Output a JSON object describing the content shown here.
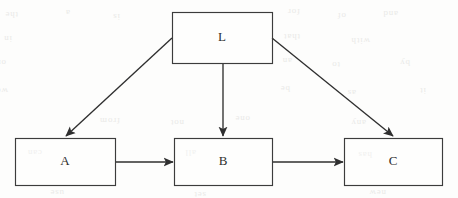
{
  "figure": {
    "kind": "directed-acyclic-graph",
    "title": "",
    "width": 458,
    "height": 198,
    "background_color": "#fdfdfc",
    "stroke_color": "#2f2f2f",
    "box_stroke_color": "#3c3c3c",
    "label_color": "#2e2e2e"
  },
  "nodes": [
    {
      "id": "L",
      "label": "L",
      "x": 172,
      "y": 12,
      "w": 100,
      "h": 51
    },
    {
      "id": "A",
      "label": "A",
      "x": 15,
      "y": 138,
      "w": 100,
      "h": 47
    },
    {
      "id": "B",
      "label": "B",
      "x": 174,
      "y": 138,
      "w": 98,
      "h": 47
    },
    {
      "id": "C",
      "label": "C",
      "x": 344,
      "y": 138,
      "w": 98,
      "h": 47
    }
  ],
  "edges": [
    {
      "id": "L-A",
      "from": "L",
      "to": "A",
      "shape": "diagonal",
      "x1": 172,
      "y1": 38,
      "x2": 66,
      "y2": 136
    },
    {
      "id": "L-B",
      "from": "L",
      "to": "B",
      "shape": "vertical",
      "x1": 223,
      "y1": 63,
      "x2": 223,
      "y2": 136
    },
    {
      "id": "L-C",
      "from": "L",
      "to": "C",
      "shape": "diagonal",
      "x1": 272,
      "y1": 38,
      "x2": 393,
      "y2": 136
    },
    {
      "id": "A-B",
      "from": "A",
      "to": "B",
      "shape": "horizontal",
      "x1": 115,
      "y1": 162,
      "x2": 173,
      "y2": 162
    },
    {
      "id": "B-C",
      "from": "B",
      "to": "C",
      "shape": "horizontal",
      "x1": 272,
      "y1": 162,
      "x2": 343,
      "y2": 162
    }
  ],
  "ghost_marks": [
    {
      "text": "the",
      "x": 18,
      "y": 12
    },
    {
      "text": "a",
      "x": 70,
      "y": 10
    },
    {
      "text": "is",
      "x": 120,
      "y": 14
    },
    {
      "text": "for",
      "x": 300,
      "y": 9
    },
    {
      "text": "of",
      "x": 346,
      "y": 13
    },
    {
      "text": "and",
      "x": 398,
      "y": 11
    },
    {
      "text": "in",
      "x": 12,
      "y": 36
    },
    {
      "text": "that",
      "x": 300,
      "y": 34
    },
    {
      "text": "with",
      "x": 370,
      "y": 38
    },
    {
      "text": "on",
      "x": 6,
      "y": 60
    },
    {
      "text": "an",
      "x": 292,
      "y": 58
    },
    {
      "text": "to",
      "x": 340,
      "y": 62
    },
    {
      "text": "by",
      "x": 410,
      "y": 60
    },
    {
      "text": "we",
      "x": 8,
      "y": 88
    },
    {
      "text": "be",
      "x": 290,
      "y": 86
    },
    {
      "text": "as",
      "x": 356,
      "y": 90
    },
    {
      "text": "it",
      "x": 426,
      "y": 88
    },
    {
      "text": "from",
      "x": 120,
      "y": 118
    },
    {
      "text": "not",
      "x": 184,
      "y": 120
    },
    {
      "text": "one",
      "x": 250,
      "y": 116
    },
    {
      "text": "any",
      "x": 366,
      "y": 120
    },
    {
      "text": "can",
      "x": 42,
      "y": 150
    },
    {
      "text": "all",
      "x": 196,
      "y": 150
    },
    {
      "text": "has",
      "x": 372,
      "y": 152
    },
    {
      "text": "use",
      "x": 64,
      "y": 190
    },
    {
      "text": "set",
      "x": 206,
      "y": 192
    },
    {
      "text": "new",
      "x": 386,
      "y": 190
    }
  ]
}
